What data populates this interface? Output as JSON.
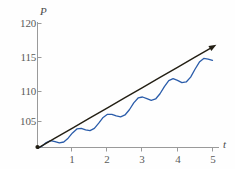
{
  "chart_data": {
    "type": "line",
    "title": "",
    "subtitle": "",
    "xlabel": "t",
    "ylabel": "P",
    "xlim": [
      0,
      5.15
    ],
    "ylim": [
      100.2,
      121.0
    ],
    "grid": false,
    "legend": null,
    "background_color": "#fefefe",
    "axis_color": "#9a9a9a",
    "x_ticks": [
      {
        "value": 1,
        "label": "1"
      },
      {
        "value": 2,
        "label": "2"
      },
      {
        "value": 3,
        "label": "3"
      },
      {
        "value": 4,
        "label": "4"
      },
      {
        "value": 5,
        "label": "5"
      }
    ],
    "y_ticks": [
      {
        "value": 105,
        "label": "105"
      },
      {
        "value": 110,
        "label": "110"
      },
      {
        "value": 115,
        "label": "115"
      },
      {
        "value": 120,
        "label": "120"
      }
    ],
    "series": [
      {
        "name": "linear-trend",
        "type": "line",
        "color": "#231f14",
        "width": 1.4,
        "arrow_end": true,
        "description": "straight rising trend line with arrowhead",
        "x": [
          0.0,
          0.5,
          1.0,
          1.5,
          2.0,
          2.5,
          3.0,
          3.5,
          4.0,
          4.5,
          5.0
        ],
        "y": [
          100.9,
          102.45,
          104.0,
          105.55,
          107.1,
          108.65,
          110.2,
          111.75,
          113.3,
          114.85,
          116.4
        ]
      },
      {
        "name": "oscillating-solution",
        "type": "line",
        "color": "#2a5caa",
        "width": 1.3,
        "arrow_end": false,
        "description": "sinusoid of growing amplitude oscillating about the trend line",
        "x": [
          0.0,
          0.125,
          0.25,
          0.375,
          0.5,
          0.625,
          0.75,
          0.875,
          1.0,
          1.125,
          1.25,
          1.375,
          1.5,
          1.625,
          1.75,
          1.875,
          2.0,
          2.125,
          2.25,
          2.375,
          2.5,
          2.625,
          2.75,
          2.875,
          3.0,
          3.125,
          3.25,
          3.375,
          3.5,
          3.625,
          3.75,
          3.875,
          4.0,
          4.125,
          4.25,
          4.375,
          4.5,
          4.625,
          4.75,
          4.875,
          5.0
        ],
        "y": [
          100.9,
          101.22,
          101.78,
          102.06,
          101.93,
          101.72,
          101.86,
          102.45,
          103.25,
          103.86,
          103.96,
          103.72,
          103.6,
          103.95,
          104.75,
          105.62,
          106.1,
          106.1,
          105.85,
          105.72,
          106.0,
          106.8,
          107.85,
          108.6,
          108.75,
          108.5,
          108.25,
          108.45,
          109.25,
          110.35,
          111.25,
          111.55,
          111.3,
          110.95,
          111.05,
          111.8,
          113.0,
          114.1,
          114.65,
          114.55,
          114.35
        ]
      }
    ],
    "annotations": []
  },
  "axis_labels": {
    "y": "P",
    "x": "t"
  }
}
